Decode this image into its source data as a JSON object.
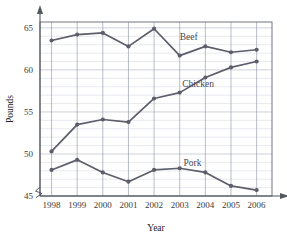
{
  "chart_data": {
    "type": "line",
    "title": "",
    "xlabel": "Year",
    "ylabel": "Pounds",
    "categories": [
      "1998",
      "1999",
      "2000",
      "2001",
      "2002",
      "2003",
      "2004",
      "2005",
      "2006"
    ],
    "x": [
      1998,
      1999,
      2000,
      2001,
      2002,
      2003,
      2004,
      2005,
      2006
    ],
    "xlim": [
      1997.55,
      2006.6
    ],
    "ylim": [
      45,
      65.7
    ],
    "y_ticks": [
      45,
      50,
      55,
      60,
      65
    ],
    "y_tick_labels": [
      "45",
      "50",
      "55",
      "60",
      "65"
    ],
    "x_tick_labels": [
      "1998",
      "1999",
      "2000",
      "2001",
      "2002",
      "2003",
      "2004",
      "2005",
      "2006"
    ],
    "grid": true,
    "grid_minor_step": 1,
    "axis_break": true,
    "legend_position": "inline-right-of-series",
    "series": [
      {
        "name": "Beef",
        "label": "Beef",
        "color": "#5d5d6b",
        "values": [
          63.5,
          64.2,
          64.4,
          62.8,
          64.9,
          61.7,
          62.8,
          62.1,
          62.4
        ],
        "label_x": 2003.0,
        "label_y": 63.6
      },
      {
        "name": "Chicken",
        "label": "Chicken",
        "color": "#5d5d6b",
        "values": [
          50.3,
          53.5,
          54.1,
          53.8,
          56.6,
          57.3,
          59.1,
          60.3,
          61.0
        ],
        "label_x": 2003.1,
        "label_y": 58.0
      },
      {
        "name": "Pork",
        "label": "Pork",
        "color": "#5d5d6b",
        "values": [
          48.1,
          49.3,
          47.8,
          46.7,
          48.1,
          48.3,
          47.8,
          46.2,
          45.7
        ],
        "label_x": 2003.15,
        "label_y": 48.6
      }
    ]
  },
  "axis": {
    "y_title": "Pounds",
    "x_title": "Year"
  },
  "colors": {
    "line": "#5d5d6b",
    "minor_grid": "#d8dce4",
    "major_grid_h": "#b9bfcb",
    "major_grid_v": "#9aa0ad",
    "frame": "#70757f",
    "axis": "#55595f",
    "text": "#222222"
  }
}
